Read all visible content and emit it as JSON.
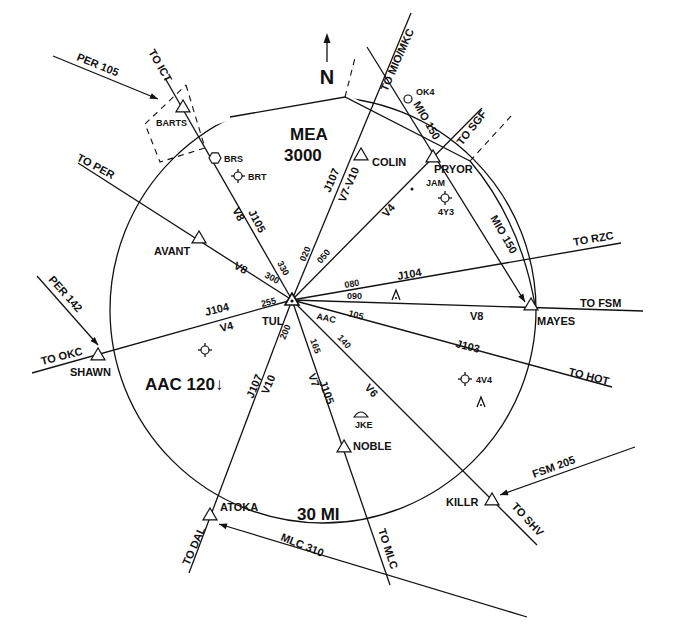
{
  "center": {
    "id": "TUL",
    "x": 292,
    "y": 300
  },
  "ring": {
    "cx": 323,
    "cy": 310,
    "r": 213,
    "label": "30 MI",
    "label_x": 297,
    "label_y": 520
  },
  "mea": {
    "line1": "MEA",
    "line2": "3000",
    "x": 290,
    "y1": 140,
    "y2": 161
  },
  "north": {
    "label": "N",
    "x": 327,
    "y": 84
  },
  "area_label": {
    "text": "AAC 120↓",
    "x": 145,
    "y": 390
  },
  "routes": [
    {
      "name": "to-ict",
      "x1": 165,
      "y1": 78,
      "label": "TO ICT",
      "lx": 148,
      "ly": 52,
      "rot": 60
    },
    {
      "name": "to-per",
      "x1": 78,
      "y1": 163,
      "label": "TO PER",
      "lx": 76,
      "ly": 160,
      "rot": 28
    },
    {
      "name": "to-okc",
      "x1": 32,
      "y1": 373,
      "label": "TO OKC",
      "lx": 42,
      "ly": 365,
      "rot": -14
    },
    {
      "name": "to-dal",
      "x1": 189,
      "y1": 573,
      "label": "TO DAL",
      "lx": 189,
      "ly": 566,
      "rot": -66
    },
    {
      "name": "to-mlc",
      "x1": 390,
      "y1": 585,
      "label": "TO MLC",
      "lx": 378,
      "ly": 530,
      "rot": 72
    },
    {
      "name": "to-shv",
      "x1": 537,
      "y1": 545,
      "label": "TO SHV",
      "lx": 511,
      "ly": 507,
      "rot": 47
    },
    {
      "name": "to-hot",
      "x1": 612,
      "y1": 387,
      "label": "TO HOT",
      "lx": 568,
      "ly": 375,
      "rot": 14
    },
    {
      "name": "to-fsm",
      "x1": 643,
      "y1": 311,
      "label": "TO FSM",
      "lx": 580,
      "ly": 307,
      "rot": 0
    },
    {
      "name": "to-rzc",
      "x1": 621,
      "y1": 243,
      "label": "TO RZC",
      "lx": 574,
      "ly": 246,
      "rot": -10
    },
    {
      "name": "to-sgf",
      "x1": 482,
      "y1": 108,
      "label": "TO SGF",
      "lx": 462,
      "ly": 146,
      "rot": -52
    },
    {
      "name": "to-mio-mkc",
      "x1": 411,
      "y1": 13,
      "label": "TO MIO/MKC",
      "lx": 387,
      "ly": 92,
      "rot": -66
    }
  ],
  "arrows": [
    {
      "name": "per-105",
      "x1": 53,
      "y1": 56,
      "x2": 158,
      "y2": 99,
      "label": "PER 105",
      "lx": 76,
      "ly": 60,
      "rot": 22
    },
    {
      "name": "per-142",
      "x1": 37,
      "y1": 276,
      "x2": 98,
      "y2": 345,
      "label": "PER 142",
      "lx": 48,
      "ly": 280,
      "rot": 48
    },
    {
      "name": "mlc-310",
      "x1": 527,
      "y1": 617,
      "x2": 219,
      "y2": 524,
      "label": "MLC 310",
      "lx": 280,
      "ly": 540,
      "rot": 22
    },
    {
      "name": "fsm-205",
      "x1": 635,
      "y1": 447,
      "x2": 500,
      "y2": 495,
      "label": "FSM 205",
      "lx": 534,
      "ly": 478,
      "rot": -20
    },
    {
      "name": "mio-150",
      "x1": 367,
      "y1": 47,
      "x2": 525,
      "y2": 302,
      "label": "MIO 150",
      "lx": 490,
      "ly": 218,
      "rot": 60
    }
  ],
  "mio_label_top": {
    "text": "MIO 150",
    "x": 413,
    "y": 104,
    "rot": 60
  },
  "fixes": [
    {
      "name": "BARTS",
      "x": 183,
      "y": 107,
      "lx": 156,
      "ly": 126,
      "size": "sm"
    },
    {
      "name": "AVANT",
      "x": 199,
      "y": 238,
      "lx": 154,
      "ly": 255,
      "size": "md"
    },
    {
      "name": "SHAWN",
      "x": 98,
      "y": 355,
      "lx": 70,
      "ly": 376,
      "size": "md"
    },
    {
      "name": "ATOKA",
      "x": 210,
      "y": 515,
      "lx": 220,
      "ly": 511,
      "size": "md"
    },
    {
      "name": "NOBLE",
      "x": 344,
      "y": 447,
      "lx": 353,
      "ly": 450,
      "size": "md"
    },
    {
      "name": "KILLR",
      "x": 492,
      "y": 500,
      "lx": 446,
      "ly": 506,
      "size": "md"
    },
    {
      "name": "MAYES",
      "x": 531,
      "y": 305,
      "lx": 537,
      "ly": 325,
      "size": "md"
    },
    {
      "name": "PRYOR",
      "x": 433,
      "y": 157,
      "lx": 434,
      "ly": 173,
      "size": "md"
    },
    {
      "name": "COLIN",
      "x": 361,
      "y": 155,
      "lx": 372,
      "ly": 166,
      "size": "md"
    }
  ],
  "airports": [
    {
      "name": "BRS",
      "x": 215,
      "y": 158,
      "lx": 224,
      "ly": 162,
      "type": "hex"
    },
    {
      "name": "BRT",
      "x": 238,
      "y": 176,
      "lx": 248,
      "ly": 180,
      "type": "star"
    },
    {
      "name": "OK4",
      "x": 408,
      "y": 99,
      "lx": 416,
      "ly": 95,
      "type": "circle"
    },
    {
      "name": "JAM",
      "x": 418,
      "y": 183,
      "lx": 426,
      "ly": 186,
      "type": "dot"
    },
    {
      "name": "4Y3",
      "x": 445,
      "y": 198,
      "lx": 438,
      "ly": 215,
      "type": "star"
    },
    {
      "name": "4V4",
      "x": 465,
      "y": 379,
      "lx": 476,
      "ly": 383,
      "type": "star"
    },
    {
      "name": "JKE",
      "x": 361,
      "y": 415,
      "lx": 355,
      "ly": 428,
      "type": "seaplane"
    },
    {
      "name": "",
      "x": 205,
      "y": 350,
      "lx": 0,
      "ly": 0,
      "type": "star"
    }
  ],
  "obstacles": [
    {
      "x": 396,
      "y": 295
    },
    {
      "x": 481,
      "y": 402
    }
  ],
  "airways": [
    {
      "label": "J105",
      "x": 248,
      "y": 212,
      "rot": 62
    },
    {
      "label": "V8",
      "x": 232,
      "y": 210,
      "rot": 62
    },
    {
      "label": "V8",
      "x": 233,
      "y": 268,
      "rot": 28
    },
    {
      "label": "J107",
      "x": 330,
      "y": 193,
      "rot": -67
    },
    {
      "label": "V7-V10",
      "x": 345,
      "y": 203,
      "rot": -67
    },
    {
      "label": "V4",
      "x": 387,
      "y": 218,
      "rot": -50
    },
    {
      "label": "J104",
      "x": 398,
      "y": 280,
      "rot": -10
    },
    {
      "label": "V8",
      "x": 470,
      "y": 320,
      "rot": 0
    },
    {
      "label": "J103",
      "x": 455,
      "y": 347,
      "rot": 14
    },
    {
      "label": "V6",
      "x": 364,
      "y": 388,
      "rot": 48
    },
    {
      "label": "J105",
      "x": 319,
      "y": 382,
      "rot": 70
    },
    {
      "label": "V7",
      "x": 308,
      "y": 375,
      "rot": 70
    },
    {
      "label": "J107",
      "x": 253,
      "y": 399,
      "rot": -67
    },
    {
      "label": "V10",
      "x": 268,
      "y": 395,
      "rot": -67
    },
    {
      "label": "J104",
      "x": 206,
      "y": 316,
      "rot": -14
    },
    {
      "label": "V4",
      "x": 221,
      "y": 332,
      "rot": -14
    }
  ],
  "radials": [
    {
      "label": "300",
      "x": 264,
      "y": 277,
      "rot": 28
    },
    {
      "label": "330",
      "x": 277,
      "y": 263,
      "rot": 62
    },
    {
      "label": "020",
      "x": 305,
      "y": 262,
      "rot": -67
    },
    {
      "label": "050",
      "x": 321,
      "y": 264,
      "rot": -50
    },
    {
      "label": "080",
      "x": 345,
      "y": 288,
      "rot": -10
    },
    {
      "label": "090",
      "x": 347,
      "y": 299,
      "rot": 0
    },
    {
      "label": "105",
      "x": 348,
      "y": 316,
      "rot": 14
    },
    {
      "label": "140",
      "x": 337,
      "y": 338,
      "rot": 48
    },
    {
      "label": "165",
      "x": 310,
      "y": 340,
      "rot": 70
    },
    {
      "label": "200",
      "x": 285,
      "y": 340,
      "rot": -67
    },
    {
      "label": "255",
      "x": 262,
      "y": 307,
      "rot": -14
    }
  ],
  "vor_labels": {
    "tul": "TUL",
    "tul_x": 262,
    "tul_y": 325,
    "aac": "AAC",
    "aac_x": 316,
    "aac_y": 319
  },
  "mea_boundary": {
    "box": [
      [
        186,
        85
      ],
      [
        205,
        148
      ],
      [
        160,
        162
      ],
      [
        145,
        124
      ],
      [
        186,
        85
      ]
    ],
    "top": [
      [
        230,
        117
      ],
      [
        345,
        97
      ],
      [
        470,
        161
      ]
    ],
    "dash1": [
      [
        345,
        97
      ],
      [
        355,
        58
      ]
    ],
    "dash2": [
      [
        470,
        161
      ],
      [
        512,
        115
      ]
    ]
  }
}
